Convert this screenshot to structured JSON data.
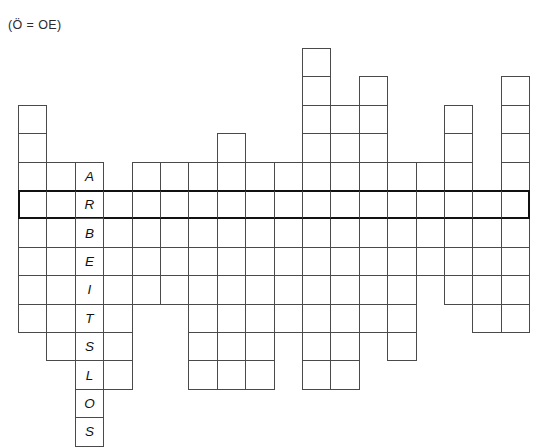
{
  "page": {
    "note": "(Ö = OE)",
    "background_color": "#ffffff",
    "grid_line_color": "#4a4a4a",
    "key_row_color": "#111111",
    "letter_color": "#111111"
  },
  "grid": {
    "columns": 18,
    "rows": 13,
    "cell_size": 28.4,
    "origin_x": 18,
    "origin_y": 48,
    "key_row_index": 5,
    "solution_word": "ARBEITSLOS",
    "solution_column": 2,
    "solution_start_row": 4,
    "letters": [
      {
        "row": 4,
        "col": 2,
        "char": "A"
      },
      {
        "row": 5,
        "col": 2,
        "char": "R"
      },
      {
        "row": 6,
        "col": 2,
        "char": "B"
      },
      {
        "row": 7,
        "col": 2,
        "char": "E"
      },
      {
        "row": 8,
        "col": 2,
        "char": "I"
      },
      {
        "row": 9,
        "col": 2,
        "char": "T"
      },
      {
        "row": 10,
        "col": 2,
        "char": "S"
      },
      {
        "row": 11,
        "col": 2,
        "char": "L"
      },
      {
        "row": 12,
        "col": 2,
        "char": "O"
      },
      {
        "row": 13,
        "col": 2,
        "char": "S"
      }
    ],
    "cells": [
      {
        "row": 2,
        "col": 0
      },
      {
        "row": 3,
        "col": 0
      },
      {
        "row": 4,
        "col": 0
      },
      {
        "row": 5,
        "col": 0
      },
      {
        "row": 6,
        "col": 0
      },
      {
        "row": 7,
        "col": 0
      },
      {
        "row": 8,
        "col": 0
      },
      {
        "row": 9,
        "col": 0
      },
      {
        "row": 4,
        "col": 1
      },
      {
        "row": 5,
        "col": 1
      },
      {
        "row": 6,
        "col": 1
      },
      {
        "row": 7,
        "col": 1
      },
      {
        "row": 8,
        "col": 1
      },
      {
        "row": 9,
        "col": 1
      },
      {
        "row": 10,
        "col": 1
      },
      {
        "row": 4,
        "col": 2
      },
      {
        "row": 5,
        "col": 2
      },
      {
        "row": 6,
        "col": 2
      },
      {
        "row": 7,
        "col": 2
      },
      {
        "row": 8,
        "col": 2
      },
      {
        "row": 9,
        "col": 2
      },
      {
        "row": 10,
        "col": 2
      },
      {
        "row": 11,
        "col": 2
      },
      {
        "row": 12,
        "col": 2
      },
      {
        "row": 13,
        "col": 2
      },
      {
        "row": 5,
        "col": 3
      },
      {
        "row": 6,
        "col": 3
      },
      {
        "row": 7,
        "col": 3
      },
      {
        "row": 8,
        "col": 3
      },
      {
        "row": 9,
        "col": 3
      },
      {
        "row": 10,
        "col": 3
      },
      {
        "row": 11,
        "col": 3
      },
      {
        "row": 4,
        "col": 4
      },
      {
        "row": 5,
        "col": 4
      },
      {
        "row": 6,
        "col": 4
      },
      {
        "row": 7,
        "col": 4
      },
      {
        "row": 8,
        "col": 4
      },
      {
        "row": 4,
        "col": 5
      },
      {
        "row": 5,
        "col": 5
      },
      {
        "row": 6,
        "col": 5
      },
      {
        "row": 7,
        "col": 5
      },
      {
        "row": 8,
        "col": 5
      },
      {
        "row": 4,
        "col": 6
      },
      {
        "row": 5,
        "col": 6
      },
      {
        "row": 6,
        "col": 6
      },
      {
        "row": 7,
        "col": 6
      },
      {
        "row": 8,
        "col": 6
      },
      {
        "row": 9,
        "col": 6
      },
      {
        "row": 10,
        "col": 6
      },
      {
        "row": 11,
        "col": 6
      },
      {
        "row": 3,
        "col": 7
      },
      {
        "row": 4,
        "col": 7
      },
      {
        "row": 5,
        "col": 7
      },
      {
        "row": 6,
        "col": 7
      },
      {
        "row": 7,
        "col": 7
      },
      {
        "row": 8,
        "col": 7
      },
      {
        "row": 9,
        "col": 7
      },
      {
        "row": 10,
        "col": 7
      },
      {
        "row": 11,
        "col": 7
      },
      {
        "row": 4,
        "col": 8
      },
      {
        "row": 5,
        "col": 8
      },
      {
        "row": 6,
        "col": 8
      },
      {
        "row": 7,
        "col": 8
      },
      {
        "row": 8,
        "col": 8
      },
      {
        "row": 9,
        "col": 8
      },
      {
        "row": 10,
        "col": 8
      },
      {
        "row": 11,
        "col": 8
      },
      {
        "row": 4,
        "col": 9
      },
      {
        "row": 5,
        "col": 9
      },
      {
        "row": 6,
        "col": 9
      },
      {
        "row": 7,
        "col": 9
      },
      {
        "row": 8,
        "col": 9
      },
      {
        "row": 9,
        "col": 9
      },
      {
        "row": 0,
        "col": 10
      },
      {
        "row": 1,
        "col": 10
      },
      {
        "row": 2,
        "col": 10
      },
      {
        "row": 3,
        "col": 10
      },
      {
        "row": 4,
        "col": 10
      },
      {
        "row": 5,
        "col": 10
      },
      {
        "row": 6,
        "col": 10
      },
      {
        "row": 7,
        "col": 10
      },
      {
        "row": 8,
        "col": 10
      },
      {
        "row": 9,
        "col": 10
      },
      {
        "row": 10,
        "col": 10
      },
      {
        "row": 11,
        "col": 10
      },
      {
        "row": 2,
        "col": 11
      },
      {
        "row": 3,
        "col": 11
      },
      {
        "row": 4,
        "col": 11
      },
      {
        "row": 5,
        "col": 11
      },
      {
        "row": 6,
        "col": 11
      },
      {
        "row": 7,
        "col": 11
      },
      {
        "row": 8,
        "col": 11
      },
      {
        "row": 9,
        "col": 11
      },
      {
        "row": 10,
        "col": 11
      },
      {
        "row": 11,
        "col": 11
      },
      {
        "row": 1,
        "col": 12
      },
      {
        "row": 2,
        "col": 12
      },
      {
        "row": 3,
        "col": 12
      },
      {
        "row": 4,
        "col": 12
      },
      {
        "row": 5,
        "col": 12
      },
      {
        "row": 6,
        "col": 12
      },
      {
        "row": 7,
        "col": 12
      },
      {
        "row": 8,
        "col": 12
      },
      {
        "row": 9,
        "col": 12
      },
      {
        "row": 4,
        "col": 13
      },
      {
        "row": 5,
        "col": 13
      },
      {
        "row": 6,
        "col": 13
      },
      {
        "row": 7,
        "col": 13
      },
      {
        "row": 8,
        "col": 13
      },
      {
        "row": 9,
        "col": 13
      },
      {
        "row": 10,
        "col": 13
      },
      {
        "row": 4,
        "col": 14
      },
      {
        "row": 5,
        "col": 14
      },
      {
        "row": 6,
        "col": 14
      },
      {
        "row": 7,
        "col": 14
      },
      {
        "row": 2,
        "col": 15
      },
      {
        "row": 3,
        "col": 15
      },
      {
        "row": 4,
        "col": 15
      },
      {
        "row": 5,
        "col": 15
      },
      {
        "row": 6,
        "col": 15
      },
      {
        "row": 7,
        "col": 15
      },
      {
        "row": 8,
        "col": 15
      },
      {
        "row": 5,
        "col": 16
      },
      {
        "row": 6,
        "col": 16
      },
      {
        "row": 7,
        "col": 16
      },
      {
        "row": 8,
        "col": 16
      },
      {
        "row": 9,
        "col": 16
      },
      {
        "row": 1,
        "col": 17
      },
      {
        "row": 2,
        "col": 17
      },
      {
        "row": 3,
        "col": 17
      },
      {
        "row": 4,
        "col": 17
      },
      {
        "row": 5,
        "col": 17
      },
      {
        "row": 6,
        "col": 17
      },
      {
        "row": 7,
        "col": 17
      },
      {
        "row": 8,
        "col": 17
      },
      {
        "row": 9,
        "col": 17
      }
    ]
  }
}
